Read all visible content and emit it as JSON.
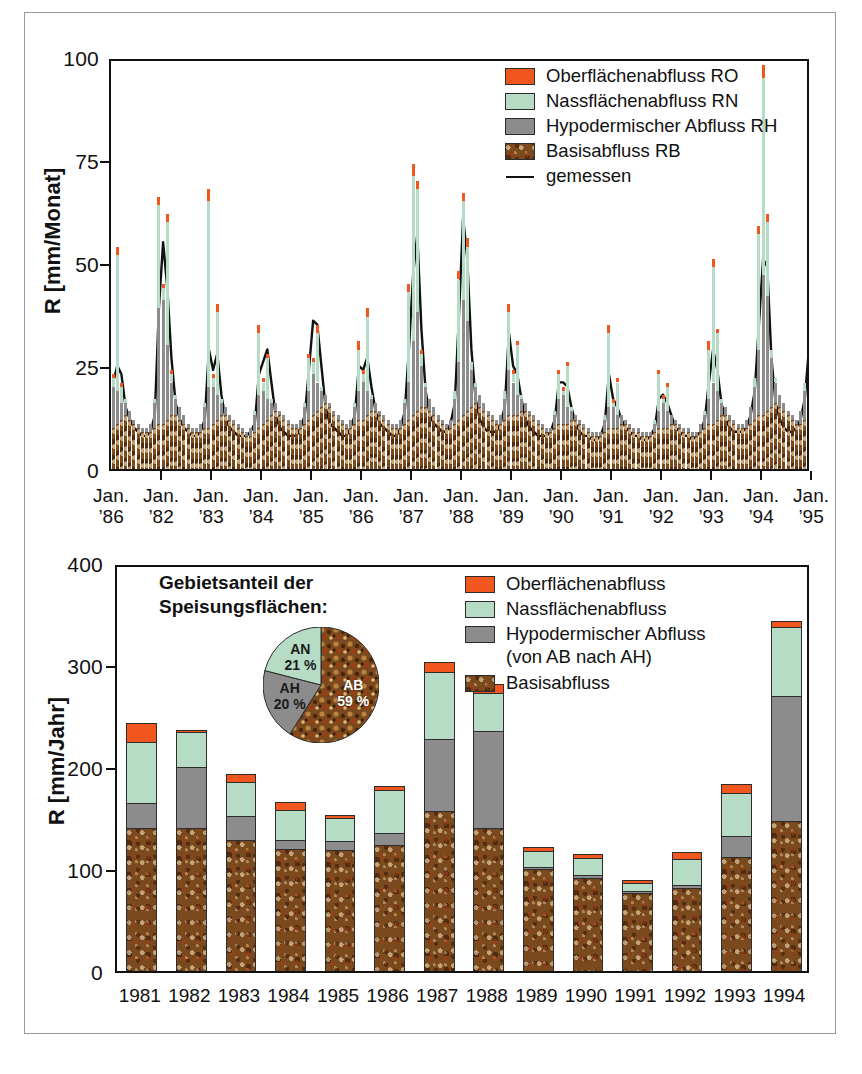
{
  "figure": {
    "colors": {
      "ro": "#f0561d",
      "rn": "#b6dcc6",
      "rh": "#8c8c8c",
      "rb": "#7a4a1e",
      "measured_line": "#111111",
      "axis": "#111111"
    }
  },
  "top_panel": {
    "legend": [
      {
        "label": "Oberflächenabfluss RO",
        "swatch": "ro"
      },
      {
        "label": "Nassflächenabfluss RN",
        "swatch": "rn"
      },
      {
        "label": "Hypodermischer Abfluss RH",
        "swatch": "rh"
      },
      {
        "label": "Basisabfluss RB",
        "swatch": "rb"
      },
      {
        "label": "gemessen",
        "swatch": "line"
      }
    ],
    "ylabel": "R  [mm/Monat]",
    "yticks": [
      "0",
      "25",
      "50",
      "75",
      "100"
    ],
    "xlabels": [
      {
        "line1": "Jan.",
        "line2": "’86"
      },
      {
        "line1": "Jan.",
        "line2": "’82"
      },
      {
        "line1": "Jan.",
        "line2": "’83"
      },
      {
        "line1": "Jan.",
        "line2": "’84"
      },
      {
        "line1": "Jan.",
        "line2": "’85"
      },
      {
        "line1": "Jan.",
        "line2": "’86"
      },
      {
        "line1": "Jan.",
        "line2": "’87"
      },
      {
        "line1": "Jan.",
        "line2": "’88"
      },
      {
        "line1": "Jan.",
        "line2": "’89"
      },
      {
        "line1": "Jan.",
        "line2": "’90"
      },
      {
        "line1": "Jan.",
        "line2": "’91"
      },
      {
        "line1": "Jan.",
        "line2": "’92"
      },
      {
        "line1": "Jan.",
        "line2": "’93"
      },
      {
        "line1": "Jan.",
        "line2": "’94"
      },
      {
        "line1": "Jan.",
        "line2": "’95"
      }
    ]
  },
  "bottom_panel": {
    "legend": [
      {
        "label": "Oberflächenabfluss",
        "swatch": "ro",
        "sub": null
      },
      {
        "label": "Nassflächenabfluss",
        "swatch": "rn",
        "sub": null
      },
      {
        "label": "Hypodermischer Abfluss",
        "swatch": "rh",
        "sub": "(von AB nach AH)"
      },
      {
        "label": "Basisabfluss",
        "swatch": "rb",
        "sub": null
      }
    ],
    "ylabel": "R  [mm/Jahr]",
    "yticks": [
      "0",
      "100",
      "200",
      "300",
      "400"
    ],
    "pie_title_line1": "Gebietsanteil der",
    "pie_title_line2": "Speisungsflächen:"
  },
  "chart_data": [
    {
      "type": "bar",
      "id": "monthly-runoff-components",
      "title": "",
      "xlabel": "",
      "ylabel": "R  [mm/Monat]",
      "ylim": [
        0,
        100
      ],
      "yticks": [
        0,
        25,
        50,
        75,
        100
      ],
      "grid": false,
      "legend_position": "top-right",
      "stacked": true,
      "series_order": [
        "Basisabfluss RB",
        "Hypodermischer Abfluss RH",
        "Nassflächenabfluss RN",
        "Oberflächenabfluss RO"
      ],
      "overlay_line": {
        "name": "gemessen",
        "color": "#111111"
      },
      "x_tick_every": 12,
      "x_tick_labels": [
        "Jan. '86",
        "Jan. '82",
        "Jan. '83",
        "Jan. '84",
        "Jan. '85",
        "Jan. '86",
        "Jan. '87",
        "Jan. '88",
        "Jan. '89",
        "Jan. '90",
        "Jan. '91",
        "Jan. '92",
        "Jan. '93",
        "Jan. '94",
        "Jan. '95"
      ],
      "months": 168,
      "series": [
        {
          "name": "Basisabfluss RB",
          "key": "rb",
          "values": [
            10,
            11,
            12,
            13,
            12,
            11,
            10,
            9,
            9,
            9,
            10,
            11,
            11,
            12,
            13,
            13,
            12,
            11,
            10,
            9,
            9,
            9,
            10,
            10,
            11,
            12,
            13,
            13,
            12,
            11,
            10,
            9,
            8,
            8,
            9,
            10,
            11,
            12,
            13,
            14,
            13,
            12,
            11,
            10,
            10,
            10,
            11,
            12,
            13,
            14,
            15,
            16,
            15,
            13,
            12,
            11,
            10,
            10,
            11,
            12,
            12,
            13,
            14,
            14,
            13,
            12,
            11,
            10,
            10,
            10,
            11,
            12,
            13,
            14,
            15,
            15,
            14,
            13,
            12,
            11,
            10,
            10,
            11,
            12,
            13,
            14,
            15,
            16,
            15,
            14,
            13,
            12,
            11,
            11,
            12,
            13,
            13,
            13,
            14,
            14,
            13,
            12,
            11,
            10,
            9,
            9,
            10,
            11,
            11,
            11,
            12,
            12,
            11,
            10,
            9,
            8,
            8,
            8,
            9,
            10,
            10,
            10,
            11,
            11,
            10,
            9,
            9,
            8,
            8,
            8,
            9,
            10,
            10,
            10,
            11,
            11,
            10,
            9,
            9,
            8,
            8,
            9,
            10,
            11,
            11,
            12,
            13,
            13,
            12,
            11,
            10,
            10,
            10,
            11,
            12,
            13,
            13,
            14,
            15,
            16,
            15,
            14,
            13,
            12,
            11,
            11,
            12,
            13
          ]
        },
        {
          "name": "Hypodermischer Abfluss RH",
          "key": "rh",
          "values": [
            10,
            8,
            4,
            3,
            2,
            1,
            1,
            1,
            1,
            2,
            6,
            28,
            30,
            18,
            8,
            4,
            3,
            2,
            1,
            1,
            1,
            2,
            5,
            10,
            9,
            6,
            3,
            2,
            1,
            1,
            1,
            1,
            1,
            2,
            4,
            8,
            8,
            5,
            3,
            2,
            1,
            1,
            1,
            1,
            1,
            2,
            4,
            7,
            10,
            7,
            4,
            2,
            1,
            1,
            1,
            1,
            1,
            2,
            4,
            7,
            9,
            6,
            3,
            2,
            1,
            1,
            1,
            1,
            1,
            2,
            5,
            9,
            18,
            24,
            10,
            5,
            3,
            2,
            1,
            1,
            1,
            2,
            6,
            14,
            28,
            22,
            9,
            4,
            3,
            2,
            1,
            1,
            1,
            2,
            5,
            11,
            8,
            5,
            3,
            2,
            1,
            1,
            1,
            1,
            1,
            1,
            3,
            6,
            7,
            4,
            2,
            1,
            1,
            1,
            1,
            1,
            1,
            1,
            3,
            5,
            5,
            3,
            2,
            1,
            1,
            1,
            1,
            1,
            1,
            1,
            2,
            4,
            6,
            4,
            2,
            1,
            1,
            1,
            1,
            1,
            1,
            2,
            3,
            6,
            10,
            7,
            3,
            2,
            1,
            1,
            1,
            1,
            2,
            4,
            8,
            16,
            34,
            28,
            12,
            5,
            3,
            2,
            1,
            1,
            1,
            3,
            7,
            13
          ]
        },
        {
          "name": "Nassflächenabfluss RN",
          "key": "rn",
          "values": [
            2,
            33,
            4,
            1,
            0,
            0,
            0,
            0,
            0,
            0,
            1,
            25,
            3,
            30,
            2,
            1,
            0,
            0,
            0,
            0,
            0,
            0,
            1,
            45,
            2,
            20,
            1,
            0,
            0,
            0,
            0,
            0,
            0,
            0,
            1,
            15,
            2,
            10,
            1,
            0,
            0,
            0,
            0,
            0,
            0,
            0,
            1,
            8,
            3,
            12,
            1,
            0,
            0,
            0,
            0,
            0,
            0,
            0,
            1,
            10,
            2,
            18,
            1,
            0,
            0,
            0,
            0,
            0,
            0,
            0,
            1,
            22,
            40,
            30,
            3,
            1,
            0,
            0,
            0,
            0,
            0,
            0,
            2,
            20,
            24,
            18,
            2,
            1,
            0,
            0,
            0,
            0,
            0,
            0,
            2,
            14,
            2,
            12,
            1,
            0,
            0,
            0,
            0,
            0,
            0,
            0,
            1,
            6,
            1,
            10,
            1,
            0,
            0,
            0,
            0,
            0,
            0,
            0,
            1,
            18,
            1,
            8,
            0,
            0,
            0,
            0,
            0,
            0,
            0,
            0,
            1,
            9,
            1,
            6,
            0,
            0,
            0,
            0,
            0,
            0,
            0,
            0,
            1,
            12,
            28,
            14,
            1,
            0,
            0,
            0,
            0,
            0,
            0,
            0,
            2,
            28,
            48,
            18,
            2,
            1,
            0,
            0,
            0,
            0,
            0,
            0,
            2,
            12
          ]
        },
        {
          "name": "Oberflächenabfluss RO",
          "key": "ro",
          "values": [
            1,
            2,
            1,
            0,
            0,
            0,
            0,
            0,
            0,
            0,
            0,
            2,
            1,
            2,
            1,
            0,
            0,
            0,
            0,
            0,
            0,
            0,
            0,
            3,
            1,
            2,
            0,
            0,
            0,
            0,
            0,
            0,
            0,
            0,
            0,
            2,
            1,
            1,
            0,
            0,
            0,
            0,
            0,
            0,
            0,
            0,
            0,
            1,
            1,
            2,
            0,
            0,
            0,
            0,
            0,
            0,
            0,
            0,
            0,
            2,
            1,
            2,
            0,
            0,
            0,
            0,
            0,
            0,
            0,
            0,
            0,
            2,
            3,
            2,
            1,
            0,
            0,
            0,
            0,
            0,
            0,
            0,
            0,
            2,
            2,
            2,
            0,
            0,
            0,
            0,
            0,
            0,
            0,
            0,
            0,
            2,
            1,
            1,
            0,
            0,
            0,
            0,
            0,
            0,
            0,
            0,
            0,
            1,
            1,
            1,
            0,
            0,
            0,
            0,
            0,
            0,
            0,
            0,
            0,
            2,
            1,
            1,
            0,
            0,
            0,
            0,
            0,
            0,
            0,
            0,
            0,
            1,
            1,
            1,
            0,
            0,
            0,
            0,
            0,
            0,
            0,
            0,
            0,
            2,
            2,
            1,
            0,
            0,
            0,
            0,
            0,
            0,
            0,
            0,
            0,
            2,
            3,
            2,
            0,
            0,
            0,
            0,
            0,
            0,
            0,
            0,
            0,
            1
          ]
        },
        {
          "name": "gemessen",
          "key": "measured",
          "values": [
            22,
            26,
            24,
            16,
            13,
            11,
            10,
            9,
            9,
            10,
            14,
            40,
            56,
            45,
            28,
            17,
            13,
            11,
            10,
            9,
            9,
            10,
            13,
            30,
            25,
            29,
            19,
            13,
            11,
            10,
            9,
            9,
            9,
            10,
            12,
            24,
            27,
            30,
            22,
            14,
            11,
            10,
            9,
            9,
            9,
            11,
            14,
            25,
            37,
            36,
            26,
            16,
            12,
            11,
            10,
            9,
            9,
            11,
            14,
            26,
            25,
            28,
            21,
            15,
            12,
            11,
            10,
            9,
            9,
            11,
            15,
            30,
            48,
            58,
            35,
            20,
            14,
            12,
            11,
            10,
            10,
            12,
            17,
            38,
            62,
            52,
            30,
            18,
            13,
            11,
            10,
            10,
            10,
            12,
            16,
            34,
            26,
            24,
            18,
            13,
            11,
            10,
            9,
            9,
            9,
            10,
            13,
            22,
            22,
            21,
            16,
            12,
            10,
            9,
            9,
            8,
            8,
            9,
            12,
            24,
            18,
            16,
            13,
            11,
            10,
            9,
            9,
            8,
            8,
            9,
            11,
            18,
            19,
            17,
            14,
            11,
            10,
            9,
            9,
            8,
            9,
            10,
            13,
            22,
            30,
            25,
            17,
            13,
            11,
            10,
            10,
            10,
            11,
            14,
            20,
            36,
            52,
            50,
            28,
            17,
            13,
            11,
            10,
            10,
            11,
            13,
            18,
            30
          ]
        }
      ]
    },
    {
      "type": "bar",
      "id": "annual-runoff-components",
      "title": "",
      "xlabel": "",
      "ylabel": "R  [mm/Jahr]",
      "ylim": [
        0,
        400
      ],
      "yticks": [
        0,
        100,
        200,
        300,
        400
      ],
      "grid": false,
      "legend_position": "top-right",
      "stacked": true,
      "categories": [
        "1981",
        "1982",
        "1983",
        "1984",
        "1985",
        "1986",
        "1987",
        "1988",
        "1989",
        "1990",
        "1991",
        "1992",
        "1993",
        "1994"
      ],
      "series": [
        {
          "name": "Basisabfluss",
          "key": "rb",
          "values": [
            140,
            140,
            128,
            120,
            119,
            124,
            157,
            140,
            100,
            91,
            76,
            81,
            112,
            147
          ]
        },
        {
          "name": "Hypodermischer Abfluss",
          "key": "rh",
          "values": [
            25,
            60,
            24,
            8,
            8,
            11,
            70,
            95,
            2,
            3,
            2,
            3,
            20,
            123
          ]
        },
        {
          "name": "Nassflächenabfluss",
          "key": "rn",
          "values": [
            60,
            34,
            33,
            30,
            23,
            42,
            66,
            38,
            16,
            17,
            8,
            26,
            43,
            67
          ]
        },
        {
          "name": "Oberflächenabfluss",
          "key": "ro",
          "values": [
            18,
            2,
            8,
            8,
            3,
            4,
            10,
            8,
            4,
            4,
            3,
            7,
            8,
            6
          ]
        }
      ],
      "totals": [
        243,
        236,
        193,
        166,
        153,
        181,
        303,
        281,
        122,
        115,
        89,
        117,
        183,
        343
      ]
    },
    {
      "type": "pie",
      "id": "speisungsflaechen-anteil",
      "title": "Gebietsanteil der Speisungsflächen:",
      "labels": [
        "AB",
        "AH",
        "AN"
      ],
      "values": [
        59,
        20,
        21
      ],
      "value_labels": [
        "59 %",
        "20 %",
        "21 %"
      ],
      "colors": [
        "#7a4a1e",
        "#8c8c8c",
        "#b6dcc6"
      ]
    }
  ]
}
